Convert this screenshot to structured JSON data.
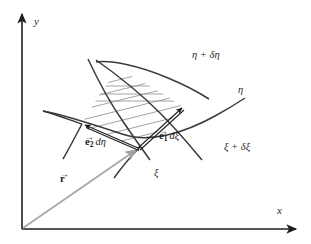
{
  "figure": {
    "background_color": "#ffffff",
    "ink_color": "#2b2b2b",
    "accent_gray": "#9a9a9a",
    "hatch_color": "#8e8e8e"
  },
  "axes": {
    "x_label": "x",
    "y_label": "y",
    "origin_label": "",
    "color": "#1f1f1f"
  },
  "curves": [
    {
      "id": "eta-plus-delta-eta",
      "label": "η + δη",
      "family": "eta"
    },
    {
      "id": "eta",
      "label": "η",
      "family": "eta"
    },
    {
      "id": "xi-plus-delta-xi",
      "label": "ξ + δξ",
      "family": "xi"
    },
    {
      "id": "xi",
      "label": "ξ",
      "family": "xi"
    }
  ],
  "vectors": [
    {
      "id": "e1-dxi",
      "base": "e",
      "subscript": "1",
      "differential": "dξ",
      "label": "e₁ dξ",
      "color": "#1a1a1a"
    },
    {
      "id": "e2-deta",
      "base": "e",
      "subscript": "2",
      "differential": "dη",
      "label": "e₂ dη",
      "color": "#1a1a1a"
    },
    {
      "id": "position-vector-r",
      "base": "r",
      "subscript": "",
      "differential": "",
      "label": "r",
      "color": "#9a9a9a"
    }
  ],
  "labels": {
    "eta_plus_delta_eta": "η + δη",
    "eta": "η",
    "xi_plus_delta_xi": "ξ + δξ",
    "xi": "ξ",
    "x_axis": "x",
    "y_axis": "y",
    "e1_base": "e",
    "e1_sub": "1",
    "e1_diff": "dξ",
    "e2_base": "e",
    "e2_sub": "2",
    "e2_diff": "dη",
    "r_base": "r",
    "vector_accent": "→"
  },
  "shaded_region": {
    "name": "coordinate-area-element",
    "hatching": "diagonal-lines",
    "hatch_line_count": 9
  }
}
